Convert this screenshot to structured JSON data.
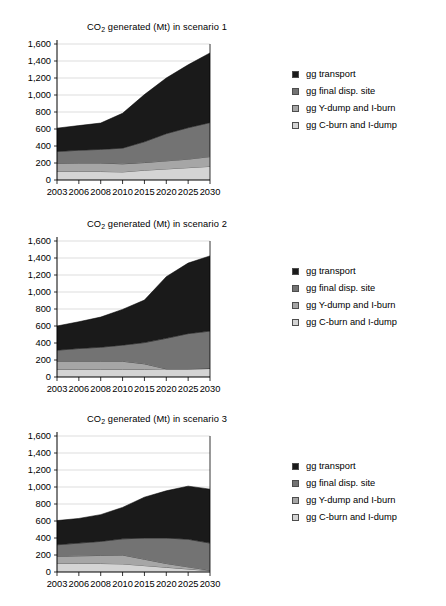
{
  "figure": {
    "panel_count": 3,
    "background": "#ffffff"
  },
  "legend": {
    "position": "right",
    "items": [
      {
        "label": "gg transport",
        "color": "#1a1a1a",
        "key": "transport"
      },
      {
        "label": "gg final disp. site",
        "color": "#737373",
        "key": "final_disp_site"
      },
      {
        "label": "gg Y-dump and I-burn",
        "color": "#a6a6a6",
        "key": "y_dump_i_burn"
      },
      {
        "label": "gg C-burn and I-dump",
        "color": "#d4d4d4",
        "key": "c_burn_i_dump"
      }
    ]
  },
  "axis": {
    "y_ticks": [
      "0",
      "200",
      "400",
      "600",
      "800",
      "1,000",
      "1,200",
      "1,400",
      "1,600"
    ],
    "y_values": [
      0,
      200,
      400,
      600,
      800,
      1000,
      1200,
      1400,
      1600
    ],
    "x_ticks": [
      "2003",
      "2006",
      "2008",
      "2010",
      "2015",
      "2020",
      "2025",
      "2030"
    ]
  },
  "titles": {
    "scenario_1_pre": "CO",
    "scenario_1_sub": "2",
    "scenario_1_post": " generated (Mt) in scenario 1",
    "scenario_2_post": " generated (Mt) in scenario 2",
    "scenario_3_post": " generated (Mt) in scenario 3"
  },
  "chart_data": [
    {
      "type": "area",
      "stacked": true,
      "title": "CO2 generated (Mt) in scenario 1",
      "xlabel": "",
      "ylabel": "",
      "ylim": [
        0,
        1600
      ],
      "grid": true,
      "legend_position": "right",
      "categories": [
        "2003",
        "2006",
        "2008",
        "2010",
        "2015",
        "2020",
        "2025",
        "2030"
      ],
      "series": [
        {
          "name": "gg C-burn and I-dump",
          "color": "#d4d4d4",
          "values": [
            100,
            100,
            100,
            95,
            115,
            130,
            145,
            160
          ]
        },
        {
          "name": "gg Y-dump and I-burn",
          "color": "#a6a6a6",
          "values": [
            95,
            100,
            100,
            95,
            90,
            95,
            100,
            115
          ]
        },
        {
          "name": "gg final disp. site",
          "color": "#737373",
          "values": [
            140,
            150,
            160,
            185,
            245,
            320,
            370,
            400
          ]
        },
        {
          "name": "gg transport",
          "color": "#1a1a1a",
          "values": [
            275,
            290,
            310,
            410,
            555,
            655,
            740,
            820
          ]
        }
      ],
      "totals": [
        610,
        640,
        670,
        785,
        1005,
        1200,
        1355,
        1495
      ]
    },
    {
      "type": "area",
      "stacked": true,
      "title": "CO2 generated (Mt) in scenario 2",
      "xlabel": "",
      "ylabel": "",
      "ylim": [
        0,
        1600
      ],
      "grid": true,
      "legend_position": "right",
      "categories": [
        "2003",
        "2006",
        "2008",
        "2010",
        "2015",
        "2020",
        "2025",
        "2030"
      ],
      "series": [
        {
          "name": "gg C-burn and I-dump",
          "color": "#d4d4d4",
          "values": [
            90,
            90,
            90,
            90,
            90,
            95,
            95,
            100
          ]
        },
        {
          "name": "gg Y-dump and I-burn",
          "color": "#a6a6a6",
          "values": [
            95,
            95,
            95,
            95,
            65,
            0,
            0,
            0
          ]
        },
        {
          "name": "gg final disp. site",
          "color": "#737373",
          "values": [
            130,
            150,
            165,
            190,
            250,
            360,
            415,
            440
          ]
        },
        {
          "name": "gg transport",
          "color": "#1a1a1a",
          "values": [
            285,
            315,
            355,
            420,
            500,
            725,
            830,
            885
          ]
        }
      ],
      "totals": [
        600,
        650,
        705,
        795,
        905,
        1180,
        1340,
        1425
      ]
    },
    {
      "type": "area",
      "stacked": true,
      "title": "CO2 generated (Mt) in scenario 3",
      "xlabel": "",
      "ylabel": "",
      "ylim": [
        0,
        1600
      ],
      "grid": true,
      "legend_position": "right",
      "categories": [
        "2003",
        "2006",
        "2008",
        "2010",
        "2015",
        "2020",
        "2025",
        "2030"
      ],
      "series": [
        {
          "name": "gg C-burn and I-dump",
          "color": "#d4d4d4",
          "values": [
            100,
            100,
            100,
            95,
            75,
            55,
            35,
            15
          ]
        },
        {
          "name": "gg Y-dump and I-burn",
          "color": "#a6a6a6",
          "values": [
            85,
            90,
            95,
            105,
            75,
            45,
            25,
            5
          ]
        },
        {
          "name": "gg final disp. site",
          "color": "#737373",
          "values": [
            135,
            150,
            165,
            190,
            250,
            300,
            325,
            320
          ]
        },
        {
          "name": "gg transport",
          "color": "#1a1a1a",
          "values": [
            285,
            290,
            315,
            370,
            480,
            555,
            625,
            635
          ]
        }
      ],
      "totals": [
        605,
        630,
        675,
        760,
        880,
        955,
        1010,
        975
      ]
    }
  ]
}
